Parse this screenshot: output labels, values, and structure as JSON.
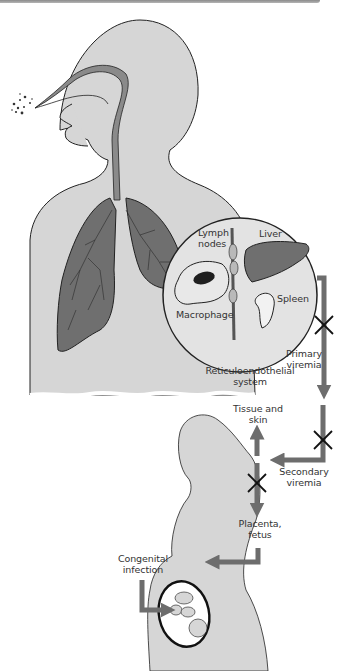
{
  "colors": {
    "body_fill": "#d6d6d6",
    "organ_fill": "#6f6f6f",
    "airway_fill": "#8a8a8a",
    "arrow_fill": "#6d6d6d",
    "outline": "#222222",
    "inset_fill": "#e3e3e3",
    "background": "#ffffff"
  },
  "labels": {
    "lymph_nodes": [
      "Lymph",
      "nodes"
    ],
    "liver": "Liver",
    "spleen": "Spleen",
    "macrophage": "Macrophage",
    "reticuloendothelial": [
      "Reticuloendothelial",
      "system"
    ],
    "primary_viremia": [
      "Primary",
      "viremia"
    ],
    "tissue_skin": [
      "Tissue and",
      "skin"
    ],
    "secondary_viremia": [
      "Secondary",
      "viremia"
    ],
    "placenta_fetus": [
      "Placenta,",
      "fetus"
    ],
    "congenital_infection": [
      "Congenital",
      "infection"
    ]
  },
  "icons": {
    "block_marks": [
      "x-mark-icon",
      "x-mark-icon",
      "x-mark-icon"
    ],
    "particles": "inhaled-particles-icon"
  }
}
